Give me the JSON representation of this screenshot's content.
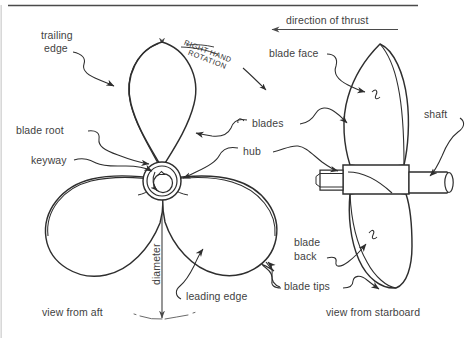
{
  "figure": {
    "title_hidden": "",
    "rotation_note": {
      "line1": "RIGHT HAND",
      "line2": "ROTATION"
    },
    "thrust": {
      "label": "direction of thrust"
    },
    "captions": {
      "aft": "view from aft",
      "starboard": "view from starboard"
    },
    "dimension": {
      "label": "diameter"
    }
  },
  "labels": {
    "trailing_edge": {
      "line1": "trailing",
      "line2": "edge"
    },
    "blade_root": "blade root",
    "keyway": "keyway",
    "blades": "blades",
    "hub": "hub",
    "leading_edge": "leading edge",
    "blade_face": "blade face",
    "shaft": "shaft",
    "blade_back": {
      "line1": "blade",
      "line2": "back"
    },
    "blade_tips": "blade tips"
  },
  "colors": {
    "ink": "#2e2e2e",
    "text": "#3f3f3f",
    "rule": "#4a4a4a",
    "paper": "#ffffff"
  }
}
